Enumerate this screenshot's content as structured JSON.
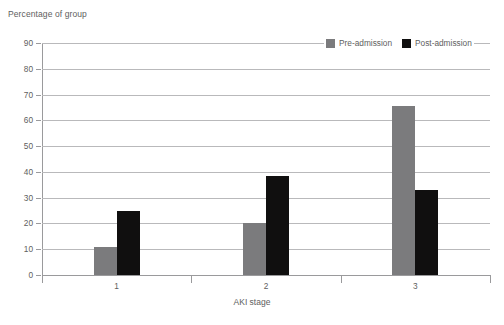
{
  "chart_data": {
    "type": "bar",
    "title": "",
    "xlabel": "AKI stage",
    "ylabel": "Percentage of group",
    "categories": [
      "1",
      "2",
      "3"
    ],
    "series": [
      {
        "name": "Pre-admission",
        "color": "#7b7b7d",
        "values": [
          11,
          20,
          65.5
        ]
      },
      {
        "name": "Post-admission",
        "color": "#100f0f",
        "values": [
          25,
          38.5,
          33
        ]
      }
    ],
    "ylim": [
      0,
      90
    ],
    "yticks": [
      0,
      10,
      20,
      30,
      40,
      50,
      60,
      70,
      80,
      90
    ],
    "ytick_labels": [
      "0",
      "10",
      "20",
      "30",
      "40",
      "50",
      "60",
      "70",
      "80",
      "90"
    ],
    "grid": true,
    "legend_position": "top-right"
  },
  "axis": {
    "axis_color": "#9a9a9c",
    "grid_color": "#b9b9bb",
    "text_color": "#5e5e60"
  }
}
